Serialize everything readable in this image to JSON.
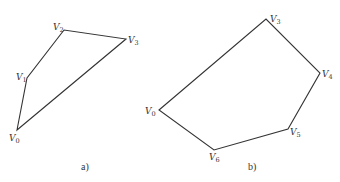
{
  "figures": [
    {
      "id": "a",
      "caption": "a)",
      "caption_pos": [
        81,
        170
      ],
      "vertices": [
        {
          "name": "V",
          "sub": "0",
          "x": 17,
          "y": 130,
          "lx": 9,
          "ly": 141
        },
        {
          "name": "V",
          "sub": "1",
          "x": 27,
          "y": 78,
          "lx": 16,
          "ly": 80
        },
        {
          "name": "V",
          "sub": "2",
          "x": 64,
          "y": 30,
          "lx": 53,
          "ly": 30
        },
        {
          "name": "V",
          "sub": "3",
          "x": 126,
          "y": 39,
          "lx": 128,
          "ly": 43
        }
      ]
    },
    {
      "id": "b",
      "caption": "b)",
      "caption_pos": [
        248,
        170
      ],
      "vertices": [
        {
          "name": "V",
          "sub": "0",
          "x": 159,
          "y": 110,
          "lx": 145,
          "ly": 114
        },
        {
          "name": "V",
          "sub": "3",
          "x": 266,
          "y": 19,
          "lx": 270,
          "ly": 22
        },
        {
          "name": "V",
          "sub": "4",
          "x": 320,
          "y": 73,
          "lx": 322,
          "ly": 77
        },
        {
          "name": "V",
          "sub": "5",
          "x": 288,
          "y": 129,
          "lx": 290,
          "ly": 135
        },
        {
          "name": "V",
          "sub": "6",
          "x": 214,
          "y": 150,
          "lx": 209,
          "ly": 160
        }
      ]
    }
  ]
}
